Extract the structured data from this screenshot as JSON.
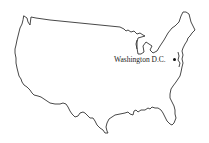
{
  "map": {
    "title": "United States outline map",
    "region": "Contiguous United States",
    "style": "black outline on white background",
    "outline_color": "#333333",
    "background_color": "#ffffff",
    "markers": [
      {
        "label": "Washington D.C.",
        "type": "city-dot",
        "color": "#111111"
      }
    ]
  }
}
